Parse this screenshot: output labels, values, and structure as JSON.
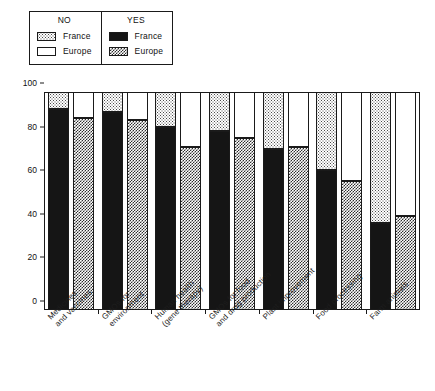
{
  "chart_data": {
    "type": "bar",
    "subtype": "stacked-percent",
    "title": "",
    "subtitle": "",
    "xlabel": "",
    "ylabel": "",
    "ylim": [
      0,
      100
    ],
    "yticks": [
      0,
      20,
      40,
      60,
      80,
      100
    ],
    "ytick_labels": [
      "0",
      "20",
      "40",
      "60",
      "80",
      "100"
    ],
    "grid": false,
    "legend_position": "top-left",
    "categories": [
      "Medicines\nand vaccines",
      "GMOs for\nenvironment",
      "Human health\n(gene therapy)",
      "GMOs for food\nand drug production",
      "Plant improvement",
      "Food processing",
      "Farm animals"
    ],
    "series": [
      {
        "name": "YES France",
        "key": "france-yes",
        "stack": "france",
        "values": [
          92,
          91,
          84,
          82,
          74,
          64,
          40
        ]
      },
      {
        "name": "NO France",
        "key": "france-no",
        "stack": "france",
        "values": [
          8,
          9,
          16,
          18,
          26,
          36,
          60
        ]
      },
      {
        "name": "YES Europe",
        "key": "europe-yes",
        "stack": "europe",
        "values": [
          88,
          87,
          75,
          79,
          75,
          59,
          43
        ]
      },
      {
        "name": "NO Europe",
        "key": "europe-no",
        "stack": "europe",
        "values": [
          12,
          13,
          25,
          21,
          25,
          41,
          57
        ]
      }
    ]
  },
  "legend": {
    "groups": [
      {
        "title": "NO",
        "entries": [
          {
            "label": "France",
            "swatch": "france-no"
          },
          {
            "label": "Europe",
            "swatch": "europe-no"
          }
        ]
      },
      {
        "title": "YES",
        "entries": [
          {
            "label": "France",
            "swatch": "france-yes"
          },
          {
            "label": "Europe",
            "swatch": "europe-yes"
          }
        ]
      }
    ]
  },
  "colors": {
    "axis": "#1a1a1a",
    "france_yes": "#151515",
    "europe_yes": "#2e2e2e",
    "france_no": "#4a4a4a",
    "europe_no": "#ffffff",
    "background": "#ffffff"
  }
}
